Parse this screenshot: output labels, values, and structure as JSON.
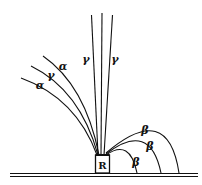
{
  "diagram": {
    "title": "",
    "source_label": "R",
    "colors": {
      "ink": "#111111",
      "background": "#ffffff"
    },
    "rays": {
      "gamma_vertical": [
        {
          "label": "γ",
          "label_x": 86,
          "label_y": 63
        },
        {
          "label": "γ",
          "label_x": 115,
          "label_y": 63
        }
      ],
      "left_curved": [
        {
          "label": "α",
          "label_x": 63,
          "label_y": 70
        },
        {
          "label": "γ",
          "label_x": 51,
          "label_y": 79
        },
        {
          "label": "α",
          "label_x": 40,
          "label_y": 89
        }
      ],
      "beta_arcs": [
        {
          "label": "β",
          "label_x": 145,
          "label_y": 134
        },
        {
          "label": "β",
          "label_x": 150,
          "label_y": 150
        },
        {
          "label": "β",
          "label_x": 136,
          "label_y": 166
        }
      ]
    }
  }
}
